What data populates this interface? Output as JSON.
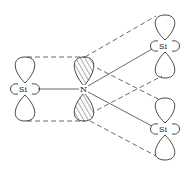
{
  "diagram": {
    "atoms": [
      {
        "id": "si_left",
        "label": "Si",
        "x": 25,
        "y": 89
      },
      {
        "id": "n_center",
        "label": "N",
        "x": 83,
        "y": 89
      },
      {
        "id": "si_upper_right",
        "label": "Si",
        "x": 165,
        "y": 46
      },
      {
        "id": "si_lower_right",
        "label": "Si",
        "x": 165,
        "y": 129
      }
    ],
    "labels": {
      "si_left": "Si",
      "n": "N",
      "si_upper_right": "Si",
      "si_lower_right": "Si"
    },
    "colors": {
      "line": "#333333",
      "background": "#ffffff"
    }
  }
}
